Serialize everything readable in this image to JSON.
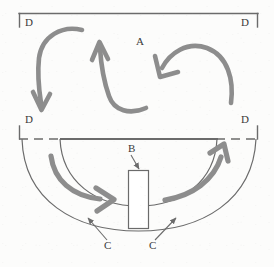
{
  "figure": {
    "background_color": "#fcfcfb",
    "line_color": "#6b6b6b",
    "arrow_color": "#8d8d8d",
    "label_color": "#3a3a3a"
  },
  "labels": {
    "a": "A",
    "b": "B",
    "c_left": "C",
    "c_right": "C",
    "d_top_left": "D",
    "d_top_right": "D",
    "d_bottom_left": "D",
    "d_bottom_right": "D"
  },
  "regions": [
    {
      "id": "chamber-a",
      "label": "A",
      "shape": "rectangle",
      "description": "upper rectangular chamber bounded by brackets labelled D at each corner"
    },
    {
      "id": "valve-b",
      "label": "B",
      "shape": "rectangle",
      "description": "narrow vertical rectangle centred on the lower arc channel"
    },
    {
      "id": "channel-c-left",
      "label": "C",
      "shape": "arc-channel",
      "description": "left lower curved channel between inner and outer arcs"
    },
    {
      "id": "channel-c-right",
      "label": "C",
      "shape": "arc-channel",
      "description": "right lower curved channel between inner and outer arcs"
    },
    {
      "id": "boundary-d",
      "label": "D",
      "shape": "bracket-corners",
      "description": "four corner brackets marking the boundary of the upper chamber"
    }
  ],
  "flow_arrows": [
    {
      "id": "arrow-upper-left",
      "direction": "down",
      "region": "A",
      "description": "curves from top-centre leftwards then downwards"
    },
    {
      "id": "arrow-upper-centre",
      "direction": "up",
      "region": "A",
      "description": "U-turn from lower right sweeping up to the left"
    },
    {
      "id": "arrow-upper-right",
      "direction": "down-left",
      "region": "A",
      "description": "arcs over from the right and points down-left"
    },
    {
      "id": "arrow-lower-left",
      "direction": "right",
      "region": "C",
      "description": "sweeps rightwards through the left channel toward B"
    },
    {
      "id": "arrow-lower-right",
      "direction": "up-right",
      "region": "C",
      "description": "sweeps up-right out of the right channel"
    }
  ]
}
